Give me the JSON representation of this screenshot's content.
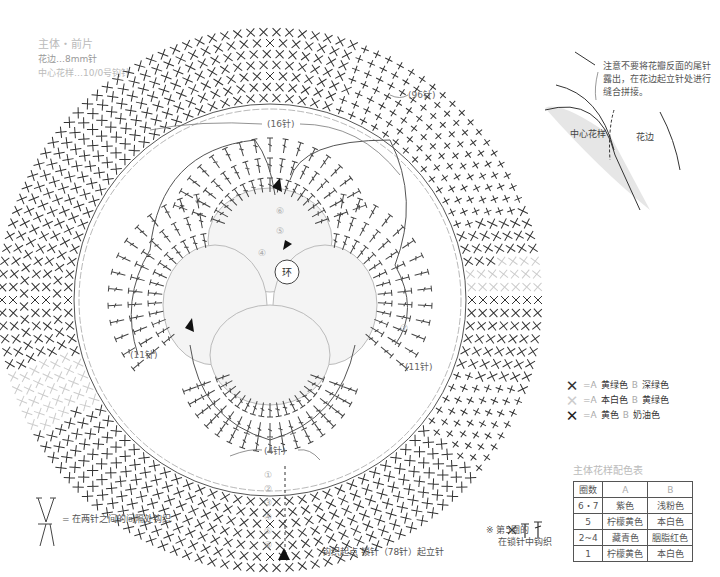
{
  "header": {
    "title": "主体・前片",
    "border_hook": "花边…8mm针",
    "center_hook": "中心花样…10/0号钩针"
  },
  "chart_labels": {
    "outer_count": "(96针)",
    "top_count": "(16针)",
    "left_count": "(11针)",
    "right_count": "(11针)",
    "bottom_count": "(4针)",
    "center_ring": "环",
    "round_numbers": [
      "①",
      "②",
      "③",
      "④",
      "⑤",
      "⑥",
      "⑦"
    ]
  },
  "detail_inset": {
    "note": "注意不要将花瓣反面的尾针露出，在花边起立针处进行缝合拼接。",
    "center_label": "中心花样",
    "border_label": "花边"
  },
  "legend": {
    "items": [
      {
        "symbol": "✕",
        "color": "#333333",
        "a": "=A",
        "a_color": "黄绿色",
        "b": "B",
        "b_color": "深绿色"
      },
      {
        "symbol": "✕",
        "color": "#cccccc",
        "a": "=A",
        "a_color": "本白色",
        "b": "B",
        "b_color": "黄绿色"
      },
      {
        "symbol": "✕",
        "color": "#222222",
        "a": "=A",
        "a_color": "黄色",
        "b": "B",
        "b_color": "奶油色"
      }
    ]
  },
  "color_table": {
    "title": "主体花样配色表",
    "headers": [
      "圈数",
      "A",
      "B"
    ],
    "rows": [
      [
        "6・7",
        "紫色",
        "浅粉色"
      ],
      [
        "5",
        "柠檬黄色",
        "本白色"
      ],
      [
        "2~4",
        "藏青色",
        "胭脂红色"
      ],
      [
        "1",
        "柠檬黄色",
        "本白色"
      ]
    ]
  },
  "notes": {
    "between_stitches": "= 在两针之间的间隔处钩织",
    "start": "钩织起点 锁针（78针）起立针",
    "round5_line1": "※ 第5圈的",
    "round5_line2": "在锁针中钩织"
  }
}
